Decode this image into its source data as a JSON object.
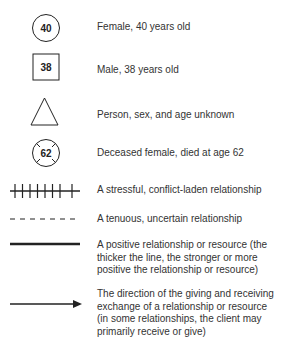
{
  "legend": {
    "items": [
      {
        "symbol": "circle",
        "symbol_label": "40",
        "label_lines": [
          "Female, 40 years old"
        ]
      },
      {
        "symbol": "square",
        "symbol_label": "38",
        "label_lines": [
          "Male, 38 years old"
        ]
      },
      {
        "symbol": "triangle",
        "symbol_label": "",
        "label_lines": [
          "Person, sex, and age unknown"
        ]
      },
      {
        "symbol": "circle-crossed",
        "symbol_label": "62",
        "label_lines": [
          "Deceased female, died at age 62"
        ]
      },
      {
        "symbol": "line-hatched",
        "symbol_label": "",
        "label_lines": [
          "A stressful, conflict-laden relationship"
        ]
      },
      {
        "symbol": "line-dashed",
        "symbol_label": "",
        "label_lines": [
          "A tenuous, uncertain relationship"
        ]
      },
      {
        "symbol": "line-thick",
        "symbol_label": "",
        "label_lines": [
          "A positive relationship or resource (the",
          "thicker the line, the stronger or more",
          "positive the relationship or resource)"
        ]
      },
      {
        "symbol": "line-arrow",
        "symbol_label": "",
        "label_lines": [
          "The direction of the giving and receiving",
          "exchange of a relationship or resource",
          "(in some relationships, the client may",
          "primarily receive or give)"
        ]
      }
    ]
  },
  "colors": {
    "stroke": "#222222",
    "text": "#333333",
    "background": "#ffffff"
  }
}
